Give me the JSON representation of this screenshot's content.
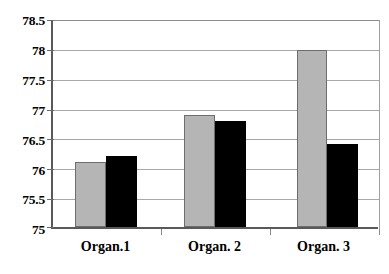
{
  "chart_data": {
    "type": "bar",
    "title": "",
    "subtitle": "",
    "xlabel": "",
    "ylabel": "",
    "categories": [
      "Organ.1",
      "Organ. 2",
      "Organ. 3"
    ],
    "series": [
      {
        "name": "series-gray",
        "color": "#b5b5b5",
        "values": [
          76.1,
          76.9,
          78.0
        ]
      },
      {
        "name": "series-black",
        "color": "#000000",
        "values": [
          76.2,
          76.8,
          76.4
        ]
      }
    ],
    "ylim": [
      75,
      78.5
    ],
    "ytick_values": [
      75,
      75.5,
      76,
      76.5,
      77,
      77.5,
      78,
      78.5
    ],
    "ytick_labels": [
      "75",
      "75.5",
      "76",
      "76.5",
      "77",
      "77.5",
      "78",
      "78.5"
    ],
    "grid": true,
    "grid_axis": "y",
    "legend": false,
    "legend_position": "none",
    "bar_group_count": 3,
    "bars_per_group": 2
  },
  "axes": {
    "y": {
      "ticks": [
        {
          "label": "78.5",
          "value": 78.5
        },
        {
          "label": "78",
          "value": 78
        },
        {
          "label": "77.5",
          "value": 77.5
        },
        {
          "label": "77",
          "value": 77
        },
        {
          "label": "76.5",
          "value": 76.5
        },
        {
          "label": "76",
          "value": 76
        },
        {
          "label": "75.5",
          "value": 75.5
        },
        {
          "label": "75",
          "value": 75
        }
      ]
    },
    "x": {
      "ticks": [
        {
          "label": "Organ.1"
        },
        {
          "label": "Organ. 2"
        },
        {
          "label": "Organ. 3"
        }
      ]
    }
  },
  "colors": {
    "series_gray": "#b5b5b5",
    "series_black": "#000000",
    "gridline": "#a8a8a8",
    "axis": "#595959",
    "background": "#ffffff"
  }
}
